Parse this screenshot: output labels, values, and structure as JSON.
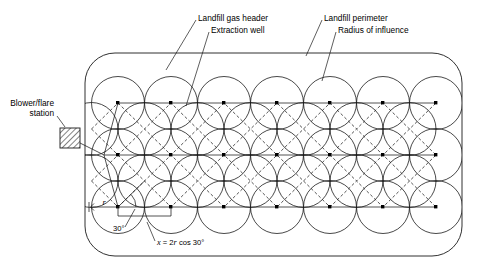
{
  "figure": {
    "background_color": "#ffffff",
    "line_color": "#1a1a1a"
  },
  "labels": {
    "landfill_gas_header": "Landfill gas header",
    "extraction_well": "Extraction well",
    "landfill_perimeter": "Landfill perimeter",
    "radius_of_influence": "Radius of influence",
    "blower_flare_line1": "Blower/flare",
    "blower_flare_line2": "station",
    "radius_symbol": "r",
    "angle": "30°",
    "spacing_formula_x": "x",
    "spacing_formula_eq": " = 2",
    "spacing_formula_r": "r",
    "spacing_formula_tail": " cos 30°"
  },
  "geometry": {
    "perimeter": {
      "x": 85,
      "y": 53,
      "width": 377,
      "height": 203,
      "corner_radius": 30
    },
    "circle_radius": 26.5,
    "rows": [
      {
        "name": "header-row-top",
        "y": 103,
        "well_count": 6,
        "first_x": 118,
        "spacing": 53
      },
      {
        "name": "header-row-middle",
        "y": 155,
        "well_count": 6,
        "first_x": 145,
        "spacing": 53
      },
      {
        "name": "header-row-bottom",
        "y": 207,
        "well_count": 6,
        "first_x": 118,
        "spacing": 53
      }
    ],
    "intermediate_rows": [
      {
        "name": "circle-row-2",
        "y": 129,
        "circle_count": 7,
        "first_x": 118,
        "spacing": 53,
        "offset": -26.5
      },
      {
        "name": "circle-row-4",
        "y": 181,
        "circle_count": 7,
        "first_x": 118,
        "spacing": 53,
        "offset": -26.5
      }
    ],
    "blower_station": {
      "x": 60,
      "y": 128,
      "width": 20,
      "height": 20,
      "hatch": "diagonal"
    },
    "dimension_r": {
      "from_x": 91,
      "to_x": 118,
      "y": 207
    },
    "dimension_x": {
      "from_x": 118,
      "to_x": 171,
      "y": 213
    }
  },
  "annotations": {
    "landfill_gas_header_leader": {
      "x1": 196,
      "y1": 19,
      "x2": 168,
      "y2": 66
    },
    "extraction_well_leader": {
      "x1": 208,
      "y1": 31,
      "x2": 184,
      "y2": 104
    },
    "landfill_perimeter_leader": {
      "x1": 322,
      "y1": 19,
      "x2": 305,
      "y2": 56
    },
    "radius_of_influence_leader": {
      "x1": 336,
      "y1": 31,
      "x2": 323,
      "y2": 80
    },
    "blower_leader": {
      "x1": 58,
      "y1": 117,
      "x2": 66,
      "y2": 127
    },
    "angle_leader": {
      "x1": 126,
      "y1": 228,
      "x2": 134,
      "y2": 208
    },
    "x_formula_leader": {
      "x1": 155,
      "y1": 242,
      "x2": 146,
      "y2": 222
    }
  }
}
